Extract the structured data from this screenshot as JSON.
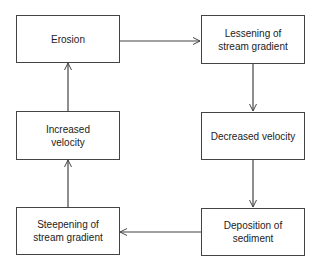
{
  "diagram": {
    "type": "cycle-flowchart",
    "nodes": [
      {
        "id": "erosion",
        "lines": [
          "Erosion"
        ]
      },
      {
        "id": "lessening",
        "lines": [
          "Lessening of",
          "stream gradient"
        ]
      },
      {
        "id": "decreased",
        "lines": [
          "Decreased velocity"
        ]
      },
      {
        "id": "deposition",
        "lines": [
          "Deposition of",
          "sediment"
        ]
      },
      {
        "id": "steepening",
        "lines": [
          "Steepening of",
          "stream gradient"
        ]
      },
      {
        "id": "increased",
        "lines": [
          "Increased",
          "velocity"
        ]
      }
    ],
    "edges": [
      {
        "from": "erosion",
        "to": "lessening"
      },
      {
        "from": "lessening",
        "to": "decreased"
      },
      {
        "from": "decreased",
        "to": "deposition"
      },
      {
        "from": "deposition",
        "to": "steepening"
      },
      {
        "from": "steepening",
        "to": "increased"
      },
      {
        "from": "increased",
        "to": "erosion"
      }
    ],
    "colors": {
      "line": "#444444",
      "text": "#222222",
      "background": "#ffffff"
    }
  }
}
